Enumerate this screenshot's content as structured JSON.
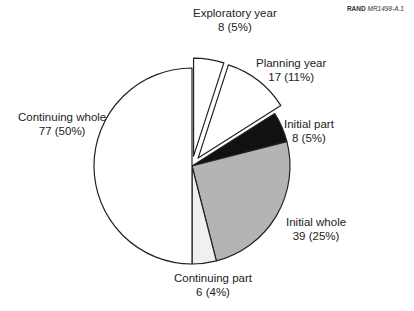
{
  "credit": {
    "org": "RAND",
    "code": "MR1498-A.1"
  },
  "chart_data": {
    "type": "pie",
    "title": "",
    "total": 155,
    "start_angle_deg": 0,
    "direction": "clockwise",
    "slices": [
      {
        "label": "Exploratory year",
        "value": 8,
        "percent": 5,
        "display": "8 (5%)",
        "fill": "#ffffff",
        "exploded": true
      },
      {
        "label": "Planning year",
        "value": 17,
        "percent": 11,
        "display": "17 (11%)",
        "fill": "#ffffff",
        "exploded": true
      },
      {
        "label": "Initial part",
        "value": 8,
        "percent": 5,
        "display": "8 (5%)",
        "fill": "#111111",
        "exploded": false
      },
      {
        "label": "Initial whole",
        "value": 39,
        "percent": 25,
        "display": "39 (25%)",
        "fill": "#b4b4b4",
        "exploded": false
      },
      {
        "label": "Continuing part",
        "value": 6,
        "percent": 4,
        "display": "6 (4%)",
        "fill": "#f0f0f0",
        "exploded": false
      },
      {
        "label": "Continuing whole",
        "value": 77,
        "percent": 50,
        "display": "77 (50%)",
        "fill": "#ffffff",
        "exploded": false
      }
    ]
  },
  "labels": {
    "exploratory": {
      "name": "Exploratory year",
      "value": "8 (5%)"
    },
    "planning": {
      "name": "Planning year",
      "value": "17 (11%)"
    },
    "initial_part": {
      "name": "Initial part",
      "value": "8 (5%)"
    },
    "initial_whole": {
      "name": "Initial whole",
      "value": "39 (25%)"
    },
    "continuing_part": {
      "name": "Continuing part",
      "value": "6 (4%)"
    },
    "continuing_whole": {
      "name": "Continuing whole",
      "value": "77 (50%)"
    }
  }
}
